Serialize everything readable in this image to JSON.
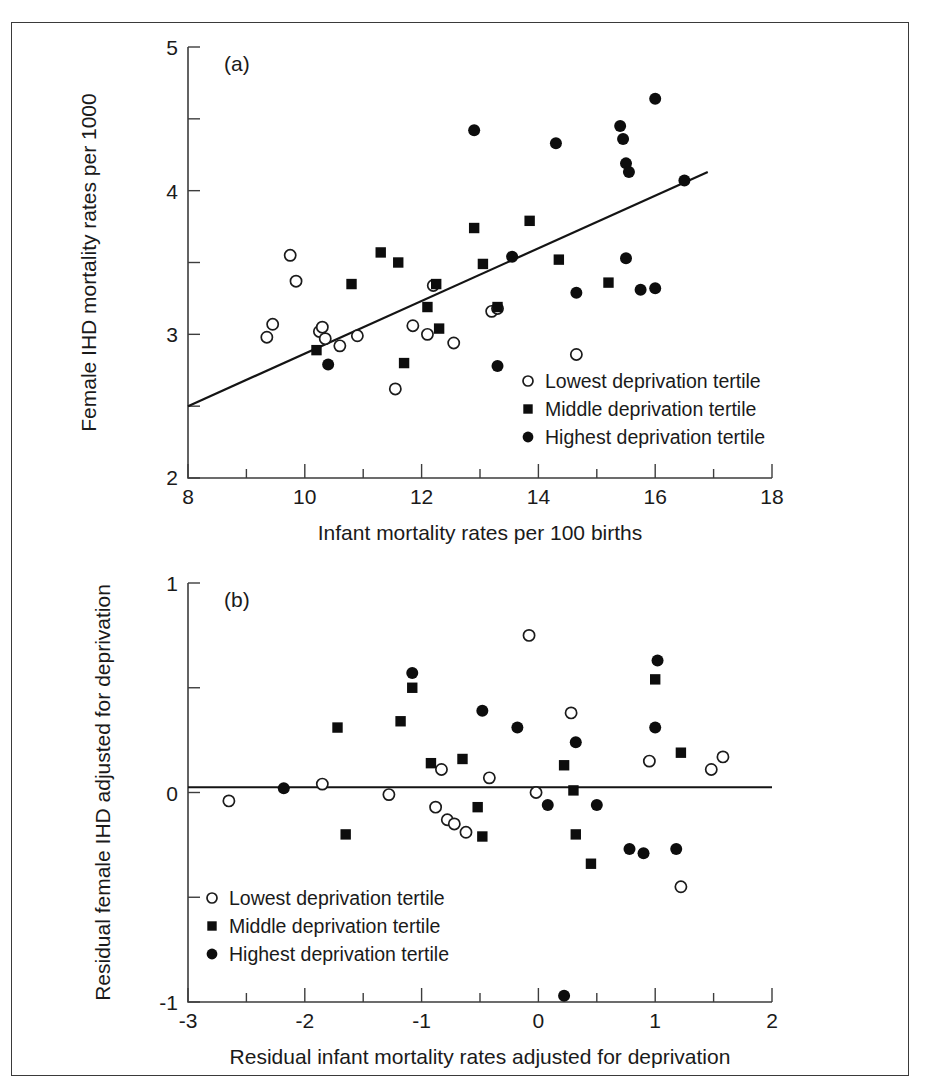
{
  "figure": {
    "border_color": "#3a3a3a",
    "background": "#ffffff"
  },
  "panel_a": {
    "label": "(a)",
    "xlabel": "Infant mortality rates per 100 births",
    "ylabel": "Female IHD mortality rates per 1000",
    "xticklabels": [
      "8",
      "10",
      "12",
      "14",
      "16",
      "18"
    ],
    "yticklabels": [
      "2",
      "3",
      "4",
      "5"
    ],
    "legend": [
      {
        "marker": "open-circle",
        "label": "Lowest deprivation tertile"
      },
      {
        "marker": "filled-square",
        "label": "Middle deprivation tertile"
      },
      {
        "marker": "filled-circle",
        "label": "Highest deprivation tertile"
      }
    ]
  },
  "panel_b": {
    "label": "(b)",
    "xlabel": "Residual infant mortality rates adjusted for deprivation",
    "ylabel": "Residual female IHD adjusted for deprivation",
    "xticklabels": [
      "-3",
      "-2",
      "-1",
      "0",
      "1",
      "2"
    ],
    "yticklabels": [
      "-1",
      "0",
      "1"
    ],
    "legend": [
      {
        "marker": "open-circle",
        "label": "Lowest deprivation tertile"
      },
      {
        "marker": "filled-square",
        "label": "Middle deprivation tertile"
      },
      {
        "marker": "filled-circle",
        "label": "Highest deprivation tertile"
      }
    ]
  },
  "chart_data": [
    {
      "type": "scatter",
      "panel": "(a)",
      "title": "",
      "xlabel": "Infant mortality rates per 100 births",
      "ylabel": "Female IHD mortality rates per 1000",
      "xlim": [
        8,
        18
      ],
      "ylim": [
        2,
        5
      ],
      "xticks": [
        8,
        10,
        12,
        14,
        16,
        18
      ],
      "xminorticks": [
        9,
        11,
        13,
        15,
        17
      ],
      "yticks": [
        2,
        3,
        4,
        5
      ],
      "yminorticks": [
        2.5,
        3.5,
        4.5
      ],
      "grid": false,
      "legend_position": "lower-right",
      "trendline": {
        "x": [
          8.0,
          16.9
        ],
        "y": [
          2.5,
          4.13
        ]
      },
      "series": [
        {
          "name": "Lowest deprivation tertile",
          "marker": "open-circle",
          "points": [
            [
              9.35,
              2.98
            ],
            [
              9.45,
              3.07
            ],
            [
              9.75,
              3.55
            ],
            [
              9.85,
              3.37
            ],
            [
              10.25,
              3.02
            ],
            [
              10.3,
              3.05
            ],
            [
              10.35,
              2.97
            ],
            [
              10.6,
              2.92
            ],
            [
              10.9,
              2.99
            ],
            [
              11.55,
              2.62
            ],
            [
              11.85,
              3.06
            ],
            [
              12.1,
              3.0
            ],
            [
              12.2,
              3.34
            ],
            [
              12.55,
              2.94
            ],
            [
              13.2,
              3.16
            ],
            [
              13.3,
              3.18
            ],
            [
              14.65,
              2.86
            ]
          ]
        },
        {
          "name": "Middle deprivation tertile",
          "marker": "filled-square",
          "points": [
            [
              10.2,
              2.89
            ],
            [
              10.8,
              3.35
            ],
            [
              11.3,
              3.57
            ],
            [
              11.6,
              3.5
            ],
            [
              11.7,
              2.8
            ],
            [
              12.1,
              3.19
            ],
            [
              12.25,
              3.35
            ],
            [
              12.3,
              3.04
            ],
            [
              12.9,
              3.74
            ],
            [
              13.05,
              3.49
            ],
            [
              13.3,
              3.19
            ],
            [
              13.85,
              3.79
            ],
            [
              14.35,
              3.52
            ],
            [
              15.2,
              3.36
            ]
          ]
        },
        {
          "name": "Highest deprivation tertile",
          "marker": "filled-circle",
          "points": [
            [
              10.4,
              2.79
            ],
            [
              12.9,
              4.42
            ],
            [
              13.3,
              2.78
            ],
            [
              13.55,
              3.54
            ],
            [
              14.3,
              4.33
            ],
            [
              14.65,
              3.29
            ],
            [
              15.4,
              4.45
            ],
            [
              15.45,
              4.36
            ],
            [
              15.5,
              4.19
            ],
            [
              15.55,
              4.13
            ],
            [
              15.5,
              3.53
            ],
            [
              15.75,
              3.31
            ],
            [
              16.0,
              3.32
            ],
            [
              16.0,
              4.64
            ],
            [
              16.5,
              4.07
            ]
          ]
        }
      ]
    },
    {
      "type": "scatter",
      "panel": "(b)",
      "title": "",
      "xlabel": "Residual infant mortality rates adjusted for deprivation",
      "ylabel": "Residual female IHD adjusted for deprivation",
      "xlim": [
        -3,
        2
      ],
      "ylim": [
        -1,
        1
      ],
      "xticks": [
        -3,
        -2,
        -1,
        0,
        1,
        2
      ],
      "xminorticks": [
        -2.5,
        -1.5,
        -0.5,
        0.5,
        1.5
      ],
      "yticks": [
        -1,
        0,
        1
      ],
      "yminorticks": [
        -0.5,
        0.5
      ],
      "grid": false,
      "legend_position": "lower-left",
      "trendline": {
        "x": [
          -3.0,
          2.0
        ],
        "y": [
          0.025,
          0.025
        ]
      },
      "series": [
        {
          "name": "Lowest deprivation tertile",
          "marker": "open-circle",
          "points": [
            [
              -2.65,
              -0.04
            ],
            [
              -1.85,
              0.04
            ],
            [
              -1.28,
              -0.01
            ],
            [
              -0.88,
              -0.07
            ],
            [
              -0.78,
              -0.13
            ],
            [
              -0.72,
              -0.15
            ],
            [
              -0.62,
              -0.19
            ],
            [
              -0.83,
              0.11
            ],
            [
              -0.42,
              0.07
            ],
            [
              -0.08,
              0.75
            ],
            [
              -0.02,
              0.0
            ],
            [
              0.28,
              0.38
            ],
            [
              0.95,
              0.15
            ],
            [
              1.22,
              -0.45
            ],
            [
              1.48,
              0.11
            ],
            [
              1.58,
              0.17
            ]
          ]
        },
        {
          "name": "Middle deprivation tertile",
          "marker": "filled-square",
          "points": [
            [
              -1.72,
              0.31
            ],
            [
              -1.65,
              -0.2
            ],
            [
              -1.18,
              0.34
            ],
            [
              -1.08,
              0.5
            ],
            [
              -0.92,
              0.14
            ],
            [
              -0.65,
              0.16
            ],
            [
              -0.52,
              -0.07
            ],
            [
              -0.48,
              -0.21
            ],
            [
              0.22,
              0.13
            ],
            [
              0.3,
              0.01
            ],
            [
              0.32,
              -0.2
            ],
            [
              1.0,
              0.54
            ],
            [
              1.22,
              0.19
            ],
            [
              0.45,
              -0.34
            ]
          ]
        },
        {
          "name": "Highest deprivation tertile",
          "marker": "filled-circle",
          "points": [
            [
              -2.18,
              0.02
            ],
            [
              -1.08,
              0.57
            ],
            [
              -0.48,
              0.39
            ],
            [
              -0.18,
              0.31
            ],
            [
              0.08,
              -0.06
            ],
            [
              0.22,
              -0.97
            ],
            [
              0.32,
              0.24
            ],
            [
              0.5,
              -0.06
            ],
            [
              0.78,
              -0.27
            ],
            [
              0.9,
              -0.29
            ],
            [
              1.0,
              0.31
            ],
            [
              1.02,
              0.63
            ],
            [
              1.18,
              -0.27
            ]
          ]
        }
      ]
    }
  ]
}
